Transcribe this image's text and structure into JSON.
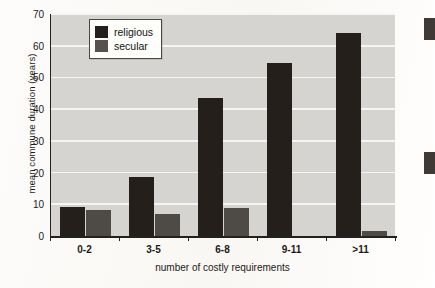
{
  "chart_data": {
    "type": "bar",
    "title": "",
    "xlabel": "number of costly requirements",
    "ylabel": "mean commune duration (years)",
    "categories": [
      "0-2",
      "3-5",
      "6-8",
      "9-11",
      ">11"
    ],
    "series": [
      {
        "name": "religious",
        "color": "#241f1a",
        "values": [
          9,
          18.7,
          43.5,
          54.5,
          64
        ]
      },
      {
        "name": "secular",
        "color": "#4e4b47",
        "values": [
          8.2,
          7,
          8.7,
          0,
          1.5
        ]
      }
    ],
    "ylim": [
      0,
      70
    ],
    "yticks": [
      0,
      10,
      20,
      30,
      40,
      50,
      60,
      70
    ],
    "grid": true,
    "legend_position": "top-left",
    "plot_background": "#d6d4d0",
    "gridline_color": "#f6f5f3"
  },
  "legend": {
    "entries": [
      {
        "label": "religious"
      },
      {
        "label": "secular"
      }
    ]
  }
}
